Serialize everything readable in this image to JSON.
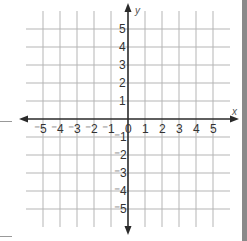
{
  "chart_data": {
    "type": "coordinate-grid",
    "title": "",
    "xlabel": "x",
    "ylabel": "y",
    "xlim": [
      -5,
      5
    ],
    "ylim": [
      -5,
      5
    ],
    "grid": true,
    "x_ticks": [
      "-5",
      "-4",
      "-3",
      "-2",
      "-1",
      "0",
      "1",
      "2",
      "3",
      "4",
      "5"
    ],
    "y_ticks_positive": [
      "5",
      "4",
      "3",
      "2",
      "1"
    ],
    "y_ticks_negative": [
      "-1",
      "-2",
      "-3",
      "-4",
      "-5"
    ],
    "origin_label": "0",
    "axes_arrows": true
  },
  "colors": {
    "grid": "#b5b5b5",
    "axis": "#2a2a2a",
    "text": "#333333",
    "right_bar": "#8a8a8a"
  }
}
